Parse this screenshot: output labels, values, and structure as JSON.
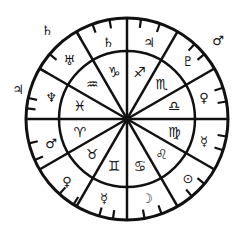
{
  "chart": {
    "title": "",
    "center": [
      127,
      119
    ],
    "outer_radius": 101,
    "inner_radius": 68,
    "stroke_color": "#111111",
    "background": "#ffffff",
    "spokes_deg": [
      0,
      30,
      60,
      90,
      120,
      150
    ],
    "ticks_deg": [
      8,
      19,
      42,
      50,
      72,
      80,
      100,
      108,
      130,
      140,
      160,
      170,
      188,
      196,
      212,
      222,
      246,
      256,
      276,
      282,
      300,
      310,
      330,
      340,
      350
    ],
    "signs": [
      {
        "name": "sagittarius",
        "glyph": "♐",
        "angle": 15
      },
      {
        "name": "scorpio",
        "glyph": "♏",
        "angle": 45
      },
      {
        "name": "libra",
        "glyph": "♎",
        "angle": 75
      },
      {
        "name": "virgo",
        "glyph": "♍",
        "angle": 105
      },
      {
        "name": "leo",
        "glyph": "♌",
        "angle": 135
      },
      {
        "name": "cancer",
        "glyph": "♋",
        "angle": 165
      },
      {
        "name": "gemini",
        "glyph": "♊",
        "angle": 195
      },
      {
        "name": "taurus",
        "glyph": "♉",
        "angle": 225
      },
      {
        "name": "aries",
        "glyph": "♈",
        "angle": 255
      },
      {
        "name": "pisces",
        "glyph": "♓",
        "angle": 285
      },
      {
        "name": "aquarius",
        "glyph": "♒",
        "angle": 315
      },
      {
        "name": "capricorn",
        "glyph": "♑",
        "angle": 345
      }
    ],
    "planets_inner": [
      {
        "name": "jupiter",
        "glyph": "♃",
        "x": 149,
        "y": 42
      },
      {
        "name": "pluto",
        "glyph": "♇",
        "x": 188,
        "y": 61
      },
      {
        "name": "venus",
        "glyph": "♀",
        "x": 204,
        "y": 97
      },
      {
        "name": "mercury",
        "glyph": "☿",
        "x": 204,
        "y": 141
      },
      {
        "name": "sun",
        "glyph": "⊙",
        "x": 188,
        "y": 178
      },
      {
        "name": "moon",
        "glyph": "☽",
        "x": 147,
        "y": 198
      },
      {
        "name": "mercury",
        "glyph": "☿",
        "x": 104,
        "y": 198
      },
      {
        "name": "venus",
        "glyph": "♀",
        "x": 67,
        "y": 181
      },
      {
        "name": "mars",
        "glyph": "♂",
        "x": 51,
        "y": 143
      },
      {
        "name": "neptune",
        "glyph": "♆",
        "x": 51,
        "y": 97
      },
      {
        "name": "uranus",
        "glyph": "♅",
        "x": 69,
        "y": 60
      },
      {
        "name": "saturn",
        "glyph": "♄",
        "x": 108,
        "y": 42
      }
    ],
    "planets_outer": [
      {
        "name": "saturn",
        "glyph": "♄",
        "x": 47,
        "y": 30
      },
      {
        "name": "jupiter",
        "glyph": "♃",
        "x": 18,
        "y": 89
      },
      {
        "name": "mars",
        "glyph": "♂",
        "x": 218,
        "y": 40
      }
    ]
  }
}
